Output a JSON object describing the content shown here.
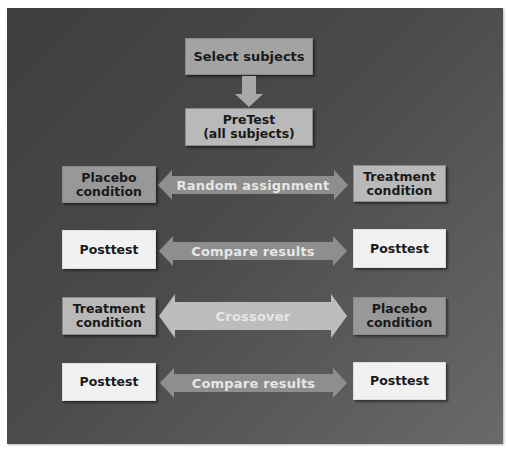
{
  "diagram": {
    "title_box": "Select subjects",
    "pretest_box": {
      "line1": "PreTest",
      "line2": "(all subjects)"
    },
    "rows": [
      {
        "left": {
          "line1": "Placebo",
          "line2": "condition"
        },
        "arrow": "Random assignment",
        "right": {
          "line1": "Treatment",
          "line2": "condition"
        }
      },
      {
        "left": {
          "line1": "Posttest"
        },
        "arrow": "Compare results",
        "right": {
          "line1": "Posttest"
        }
      },
      {
        "left": {
          "line1": "Treatment",
          "line2": "condition"
        },
        "arrow": "Crossover",
        "right": {
          "line1": "Placebo",
          "line2": "condition"
        }
      },
      {
        "left": {
          "line1": "Posttest"
        },
        "arrow": "Compare results",
        "right": {
          "line1": "Posttest"
        }
      }
    ],
    "colors": {
      "panel": "#4a4a4a",
      "box_dark": "#989898",
      "box_mid": "#b9b9b9",
      "box_light": "#f1f1f1",
      "arrow": "#8e8e8e",
      "arrow_light": "#bdbdbd",
      "arrow_text": "#e6e6e6"
    }
  }
}
